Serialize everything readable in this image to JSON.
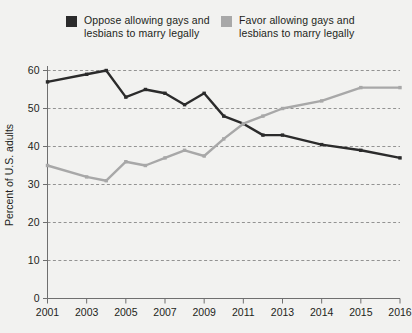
{
  "legend": {
    "entries": [
      {
        "name": "oppose",
        "label": "Oppose allowing gays and\nlesbians to marry legally",
        "color": "#2b2b2b",
        "swatch_icon": "square-marker-icon"
      },
      {
        "name": "favor",
        "label": "Favor allowing gays and\nlesbians to marry legally",
        "color": "#a8a8a8",
        "swatch_icon": "square-marker-icon"
      }
    ]
  },
  "axes": {
    "ylabel": "Percent of U.S. adults",
    "y_ticks": [
      "0",
      "10",
      "20",
      "30",
      "40",
      "50",
      "60"
    ],
    "x_ticks": [
      "2001",
      "2003",
      "2005",
      "2007",
      "2009",
      "2011",
      "2013",
      "2014",
      "2015",
      "2016"
    ]
  },
  "colors": {
    "background": "#f2f2f0",
    "oppose": "#2b2b2b",
    "favor": "#a8a8a8",
    "axis": "#6f6f6f",
    "grid": "#7a7a7a",
    "text": "#231f20"
  },
  "chart_data": {
    "type": "line",
    "title": "",
    "subtitle": "",
    "xlabel": "",
    "ylabel": "Percent of U.S. adults",
    "ylim": [
      0,
      62
    ],
    "ytick_values": [
      0,
      10,
      20,
      30,
      40,
      50,
      60
    ],
    "xtick_labels": [
      "2001",
      "2003",
      "2005",
      "2007",
      "2009",
      "2011",
      "2013",
      "2014",
      "2015",
      "2016"
    ],
    "xtick_years": [
      2001,
      2003,
      2005,
      2007,
      2009,
      2011,
      2013,
      2014,
      2015,
      2016
    ],
    "grid": "horizontal-dashed",
    "legend_position": "top",
    "x": [
      2001,
      2003,
      2004,
      2005,
      2006,
      2007,
      2008,
      2009,
      2010,
      2011,
      2012,
      2013,
      2014,
      2015,
      2016
    ],
    "series": [
      {
        "name": "Oppose allowing gays and lesbians to marry legally",
        "color": "#2b2b2b",
        "values": [
          57,
          59,
          60,
          53,
          55,
          54,
          51,
          54,
          48,
          46,
          43,
          43,
          40.5,
          39,
          37
        ]
      },
      {
        "name": "Favor allowing gays and lesbians to marry legally",
        "color": "#a8a8a8",
        "values": [
          35,
          32,
          31,
          36,
          35,
          37,
          39,
          37.5,
          42,
          46,
          48,
          50,
          52,
          55.5,
          55.5
        ]
      }
    ]
  }
}
